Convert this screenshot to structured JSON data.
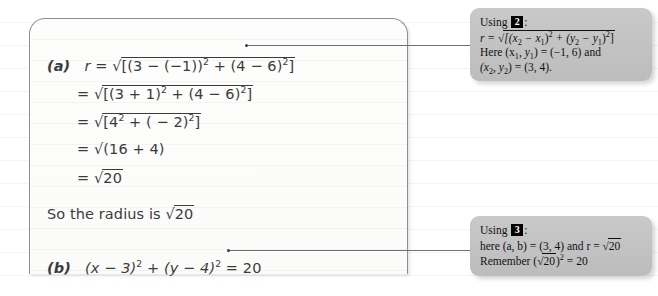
{
  "work_panel": {
    "part_a_label": "(a)",
    "part_b_label": "(b)",
    "lines": [
      "r = √[(3 − (−1))² + (4 − 6)²]",
      "= √[(3 + 1)² + (4 − 6)²]",
      "= √[4² + ( − 2)²]",
      "= √(16 + 4)",
      "= √20"
    ],
    "conclusion": "So the radius is √20",
    "part_b_equation": "(x − 3)² + (y − 4)² = 20",
    "line1_prefix": "r = ",
    "line1_body": "[(3 − (−1))",
    "line1_mid": " + (4 − 6)",
    "line1_end": "]",
    "line2_prefix": "= ",
    "line2_body": "[(3 + 1)",
    "line2_mid": " + (4 − 6)",
    "line2_end": "]",
    "line3_prefix": "= ",
    "line3_body": "[4",
    "line3_mid": " + ( − 2)",
    "line3_end": "]",
    "line4_prefix": "= ",
    "line4_body": "(16 + 4)",
    "line5_prefix": "= ",
    "line5_radicand": "20",
    "conclusion_prefix": "So the radius is ",
    "conclusion_radicand": "20",
    "pb_part1": "(x − 3)",
    "pb_part2": " + (y − 4)",
    "pb_part3": " = 20",
    "exponent": "2"
  },
  "callout_top": {
    "using_label": "Using",
    "badge": "2",
    "colon": ":",
    "formula_prefix": "r = ",
    "formula_radicand": "[(x",
    "formula_sub1": "2",
    "formula_mid1": " − x",
    "formula_sub2": "1",
    "formula_mid2": ")",
    "formula_sup1": "2",
    "formula_mid3": " + (y",
    "formula_sub3": "2",
    "formula_mid4": " − y",
    "formula_sub4": "1",
    "formula_mid5": ")",
    "formula_sup2": "2",
    "formula_end": "]",
    "line3_a": "Here (x",
    "line3_sub1": "1",
    "line3_b": ", y",
    "line3_sub2": "1",
    "line3_c": ") = (−1, 6) and",
    "line4_a": "(x",
    "line4_sub1": "2",
    "line4_b": ", y",
    "line4_sub2": "2",
    "line4_c": ") = (3, 4)."
  },
  "callout_bottom": {
    "using_label": "Using",
    "badge": "3",
    "colon": ":",
    "line2_a": "here (a, b) = (3, 4) and r = √",
    "line2_radicand": "20",
    "line3_a": "Remember (√",
    "line3_radicand": "20",
    "line3_b": ")",
    "line3_sup": "2",
    "line3_c": " = 20"
  },
  "colors": {
    "panel_border": "#8d8f92",
    "handwriting": "#3b3b3d",
    "callout_bg": "#c4c4c4",
    "badge_bg": "#000000",
    "leader_line": "#6e7073"
  }
}
